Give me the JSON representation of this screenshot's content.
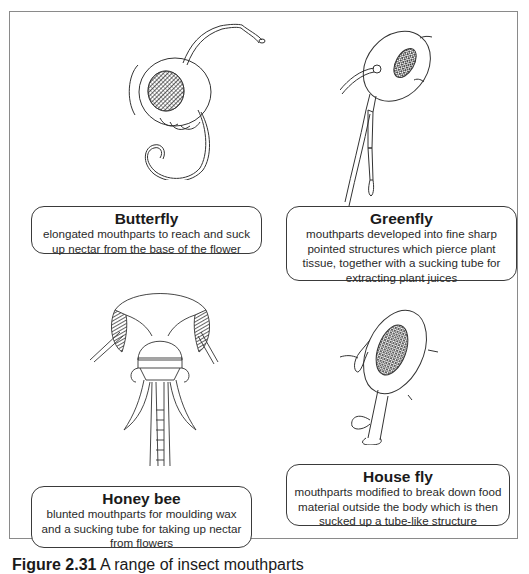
{
  "figure": {
    "caption_number": "Figure 2.31",
    "caption_text": "A range of insect mouthparts"
  },
  "panels": [
    {
      "id": "butterfly",
      "title": "Butterfly",
      "description": "elongated mouthparts to reach and suck up nectar from the base of the flower",
      "description_lines": [
        "elongated mouthparts to reach and suck",
        "up nectar from the base of the flower"
      ]
    },
    {
      "id": "greenfly",
      "title": "Greenfly",
      "description": "mouthparts developed into fine sharp pointed structures which pierce plant tissue, together with a sucking tube for extracting plant juices",
      "description_lines": [
        "mouthparts developed into fine sharp",
        "pointed structures which pierce plant",
        "tissue, together with a sucking tube for",
        "extracting plant juices"
      ]
    },
    {
      "id": "honey-bee",
      "title": "Honey bee",
      "description": "blunted mouthparts for moulding wax and a sucking tube for taking up nectar from flowers",
      "description_lines": [
        "blunted mouthparts for moulding wax",
        "and a sucking tube for taking up nectar",
        "from flowers"
      ]
    },
    {
      "id": "house-fly",
      "title": "House fly",
      "description": "mouthparts modified to break down food material outside the body which is then sucked up a tube-like structure",
      "description_lines": [
        "mouthparts modified to break down food",
        "material outside the body which is then",
        "sucked up a tube-like structure"
      ]
    }
  ]
}
